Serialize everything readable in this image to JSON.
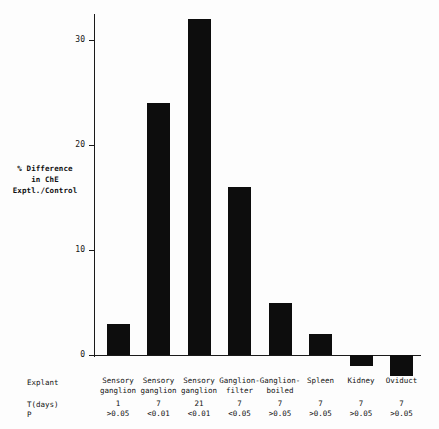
{
  "chart_data": {
    "type": "bar",
    "title": "",
    "subtitle": "",
    "xlabel": "Explant",
    "ylabel": "% Difference in ChE Exptl./Control",
    "ylabel_lines": [
      "% Difference",
      "in ChE",
      "Exptl./Control"
    ],
    "categories": [
      "Sensory ganglion",
      "Sensory ganglion",
      "Sensory ganglion",
      "Ganglion-filter",
      "Ganglion-boiled",
      "Spleen",
      "Kidney",
      "Oviduct"
    ],
    "category_lines": [
      [
        "Sensory",
        "ganglion"
      ],
      [
        "Sensory",
        "ganglion"
      ],
      [
        "Sensory",
        "ganglion"
      ],
      [
        "Ganglion-",
        "filter"
      ],
      [
        "Ganglion-",
        "boiled"
      ],
      [
        "Spleen",
        ""
      ],
      [
        "Kidney",
        ""
      ],
      [
        "Oviduct",
        ""
      ]
    ],
    "values": [
      3,
      24,
      32,
      16,
      5,
      2,
      -1,
      -2
    ],
    "t_days": [
      "1",
      "7",
      "21",
      "7",
      "7",
      "7",
      "7",
      "7"
    ],
    "p_values": [
      ">0.05",
      "<0.01",
      "<0.01",
      "<0.05",
      ">0.05",
      ">0.05",
      ">0.05",
      ">0.05"
    ],
    "yticks": [
      0,
      10,
      20,
      30
    ],
    "ytick_labels": [
      "0",
      "10",
      "20",
      "30"
    ],
    "ylim": [
      -3,
      33
    ],
    "grid": false,
    "legend": "none",
    "bar_color": "#0d0d0d",
    "axis_color": "#1a1a1a"
  },
  "row_labels": {
    "explant": "Explant",
    "t_days": "T(days)",
    "p": "P"
  }
}
